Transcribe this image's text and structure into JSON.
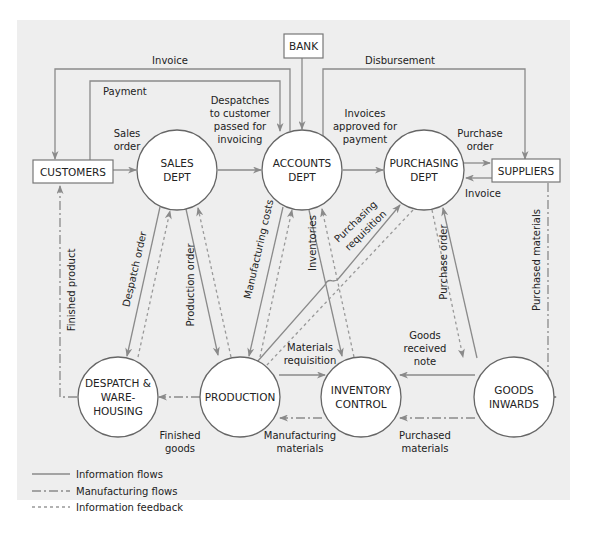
{
  "diagram": {
    "type": "data-flow-diagram",
    "colors": {
      "panel": "#eeeeee",
      "line": "#8a8a8a",
      "node_fill": "#ffffff",
      "text": "#222222"
    },
    "external_entities": {
      "customers": "CUSTOMERS",
      "bank": "BANK",
      "suppliers": "SUPPLIERS"
    },
    "processes": {
      "sales": [
        "SALES",
        "DEPT"
      ],
      "accounts": [
        "ACCOUNTS",
        "DEPT"
      ],
      "purchasing": [
        "PURCHASING",
        "DEPT"
      ],
      "despatch": [
        "DESPATCH &",
        "WARE-",
        "HOUSING"
      ],
      "production": [
        "PRODUCTION"
      ],
      "inventory": [
        "INVENTORY",
        "CONTROL"
      ],
      "goods_inwards": [
        "GOODS",
        "INWARDS"
      ]
    },
    "flows": {
      "invoice_top": "Invoice",
      "payment": "Payment",
      "disbursement": "Disbursement",
      "sales_order": [
        "Sales",
        "order"
      ],
      "despatches": [
        "Despatches",
        "to customer",
        "passed for",
        "invoicing"
      ],
      "invoices_approved": [
        "Invoices",
        "approved for",
        "payment"
      ],
      "purchase_order_right": [
        "Purchase",
        "order"
      ],
      "invoice_right": "Invoice",
      "finished_product": "Finished product",
      "despatch_order": "Despatch order",
      "production_order": "Production order",
      "manufacturing_costs": "Manufacturing costs",
      "inventories": "Inventories",
      "purchasing_requisition": [
        "Purchasing",
        "requisition"
      ],
      "purchase_order_mid": "Purchase order",
      "purchased_materials_vertical": "Purchased materials",
      "materials_requisition": [
        "Materials",
        "requisition"
      ],
      "goods_received_note": [
        "Goods",
        "received",
        "note"
      ],
      "finished_goods": [
        "Finished",
        "goods"
      ],
      "manufacturing_materials": [
        "Manufacturing",
        "materials"
      ],
      "purchased_materials_bottom": [
        "Purchased",
        "materials"
      ]
    },
    "legend": [
      {
        "style": "solid",
        "label": "Information flows"
      },
      {
        "style": "dash-dot",
        "label": "Manufacturing flows"
      },
      {
        "style": "dotted",
        "label": "Information feedback"
      }
    ]
  }
}
